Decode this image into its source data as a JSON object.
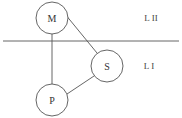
{
  "diagram": {
    "nodes": [
      {
        "id": "M",
        "label": "M"
      },
      {
        "id": "S",
        "label": "S"
      },
      {
        "id": "P",
        "label": "P"
      }
    ],
    "edges": [
      {
        "from": "M",
        "to": "S"
      },
      {
        "from": "M",
        "to": "P"
      },
      {
        "from": "P",
        "to": "S"
      }
    ],
    "levels": [
      {
        "label": "L II"
      },
      {
        "label": "L I"
      }
    ]
  }
}
